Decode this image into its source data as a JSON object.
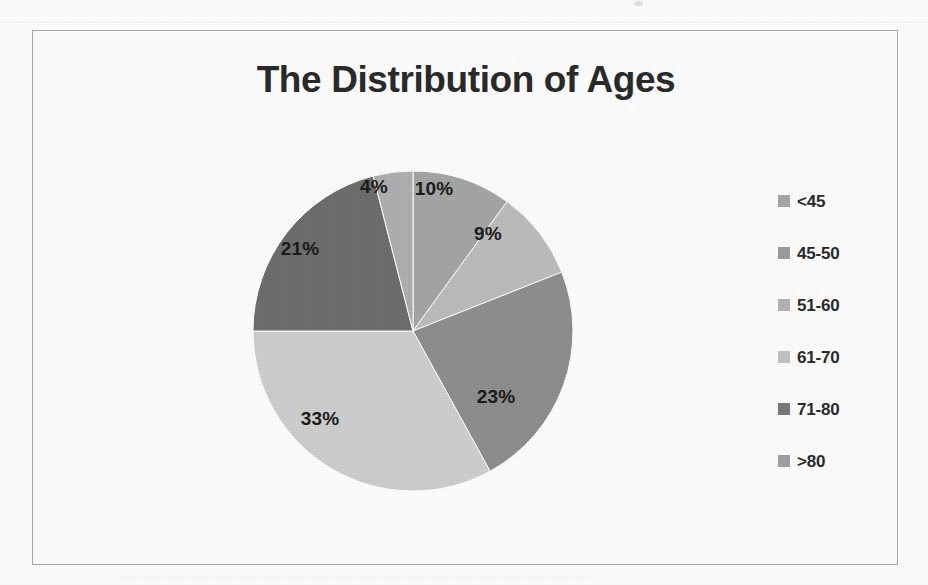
{
  "chart_data": {
    "type": "pie",
    "title": "The Distribution of Ages",
    "xlabel": "",
    "ylabel": "",
    "legend_position": "right",
    "grid": false,
    "value_label_suffix": "%",
    "categories": [
      "<45",
      "45-50",
      "51-60",
      "61-70",
      "71-80",
      ">80"
    ],
    "values": [
      10,
      9,
      23,
      33,
      21,
      4
    ],
    "labels": [
      "10%",
      "9%",
      "23%",
      "33%",
      "21%",
      "4%"
    ],
    "colors": [
      "#a6a6a6",
      "#bdbdbd",
      "#8f8f8f",
      "#cfcfcf",
      "#6e6e6e",
      "#b0b0b0"
    ],
    "slices": [
      {
        "name": "<45",
        "label": "10%",
        "value": 10,
        "color": "#a6a6a6",
        "start_deg": 0,
        "end_deg": 36,
        "label_x": 212,
        "label_y": 50
      },
      {
        "name": "45-50",
        "label": "9%",
        "value": 9,
        "color": "#bdbdbd",
        "start_deg": 36,
        "end_deg": 68.4,
        "label_x": 266,
        "label_y": 95
      },
      {
        "name": "51-60",
        "label": "23%",
        "value": 23,
        "color": "#8f8f8f",
        "start_deg": 68.4,
        "end_deg": 151.2,
        "label_x": 274,
        "label_y": 258
      },
      {
        "name": "61-70",
        "label": "33%",
        "value": 33,
        "color": "#cfcfcf",
        "start_deg": 151.2,
        "end_deg": 270,
        "label_x": 98,
        "label_y": 280
      },
      {
        "name": "71-80",
        "label": "21%",
        "value": 21,
        "color": "#6e6e6e",
        "start_deg": 270,
        "end_deg": 345.6,
        "label_x": 78,
        "label_y": 110
      },
      {
        "name": ">80",
        "label": "4%",
        "value": 4,
        "color": "#b0b0b0",
        "start_deg": 345.6,
        "end_deg": 360,
        "label_x": 152,
        "label_y": 48
      }
    ]
  },
  "chart": {
    "title": "The Distribution of Ages",
    "border_color": "#a9a9ad",
    "background": "#ffffff",
    "pie": {
      "center_x": 191,
      "center_y": 192,
      "radius": 160,
      "outline_color": "#ffffff"
    }
  },
  "legend": {
    "items": [
      {
        "label": "<45",
        "color": "#a6a6a6"
      },
      {
        "label": "45-50",
        "color": "#9d9d9d"
      },
      {
        "label": "51-60",
        "color": "#b4b4b4"
      },
      {
        "label": "61-70",
        "color": "#c4c4c4"
      },
      {
        "label": "71-80",
        "color": "#7b7b7b"
      },
      {
        "label": ">80",
        "color": "#a2a2a2"
      }
    ]
  }
}
